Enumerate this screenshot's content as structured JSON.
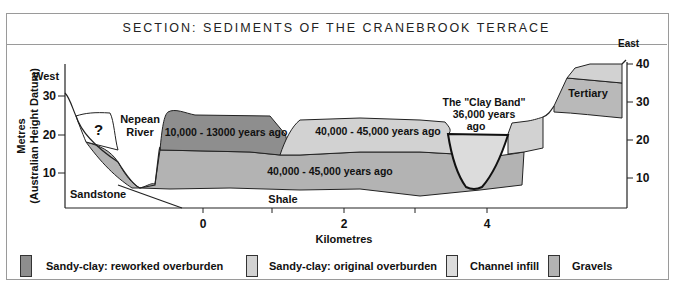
{
  "title": "SECTION: SEDIMENTS OF THE CRANEBROOK TERRACE",
  "axes": {
    "y_label_line1": "Metres",
    "y_label_line2": "(Australian Height Datum)",
    "x_label": "Kilometres",
    "left_ticks": [
      "30",
      "20",
      "10"
    ],
    "right_ticks": [
      "40",
      "30",
      "20",
      "10"
    ],
    "x_ticks": [
      "0",
      "2",
      "4"
    ]
  },
  "labels": {
    "west": "West",
    "east": "East",
    "question": "?",
    "nepean_line1": "Nepean",
    "nepean_line2": "River",
    "reworked_age": "10,000 - 13000 years ago",
    "original_age": "40,000 - 45,000 years ago",
    "gravels_age": "40,000 - 45,000 years ago",
    "clay_band_line1": "The \"Clay Band\"",
    "clay_band_line2": "36,000 years",
    "clay_band_line3": "ago",
    "tertiary": "Tertiary",
    "sandstone": "Sandstone",
    "shale": "Shale"
  },
  "legend": [
    {
      "label": "Sandy-clay: reworked overburden",
      "color": "#8e8e8e"
    },
    {
      "label": "Sandy-clay: original overburden",
      "color": "#d2d2d2"
    },
    {
      "label": "Channel infill",
      "color": "#dcdcdc"
    },
    {
      "label": "Gravels",
      "color": "#b3b3b3"
    }
  ],
  "colors": {
    "reworked": "#8e8e8e",
    "original": "#d2d2d2",
    "channel": "#dcdcdc",
    "gravels": "#b3b3b3",
    "tertiary": "#b9b9b9"
  }
}
